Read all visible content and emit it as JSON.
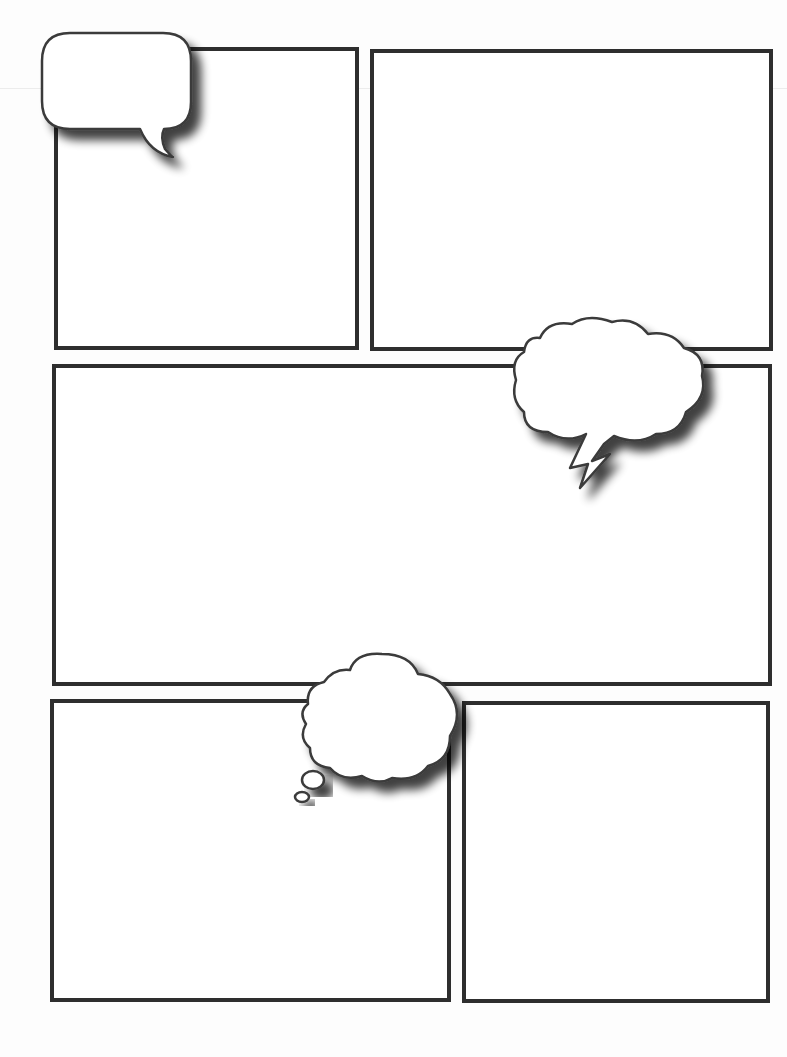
{
  "page": {
    "background": "#fdfdfd",
    "border_color": "#2e2e2e",
    "bubble_fill": "#ffffff"
  },
  "panels": [
    {
      "id": "panel-1",
      "row": 1,
      "x": 54,
      "y": 47,
      "w": 305,
      "h": 303
    },
    {
      "id": "panel-2",
      "row": 1,
      "x": 370,
      "y": 49,
      "w": 403,
      "h": 302
    },
    {
      "id": "panel-3",
      "row": 2,
      "x": 52,
      "y": 364,
      "w": 720,
      "h": 322
    },
    {
      "id": "panel-4",
      "row": 3,
      "x": 50,
      "y": 699,
      "w": 401,
      "h": 303
    },
    {
      "id": "panel-5",
      "row": 3,
      "x": 462,
      "y": 701,
      "w": 308,
      "h": 302
    }
  ],
  "bubbles": [
    {
      "id": "speech-bubble",
      "type": "speech",
      "text": ""
    },
    {
      "id": "shout-bubble",
      "type": "cloud-with-lightning-tail",
      "text": ""
    },
    {
      "id": "thought-bubble",
      "type": "thought",
      "text": ""
    }
  ]
}
